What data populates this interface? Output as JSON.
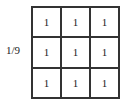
{
  "scale_factor": "1/9",
  "kernel": {
    "rows": [
      [
        "1",
        "1",
        "1"
      ],
      [
        "1",
        "1",
        "1"
      ],
      [
        "1",
        "1",
        "1"
      ]
    ]
  }
}
